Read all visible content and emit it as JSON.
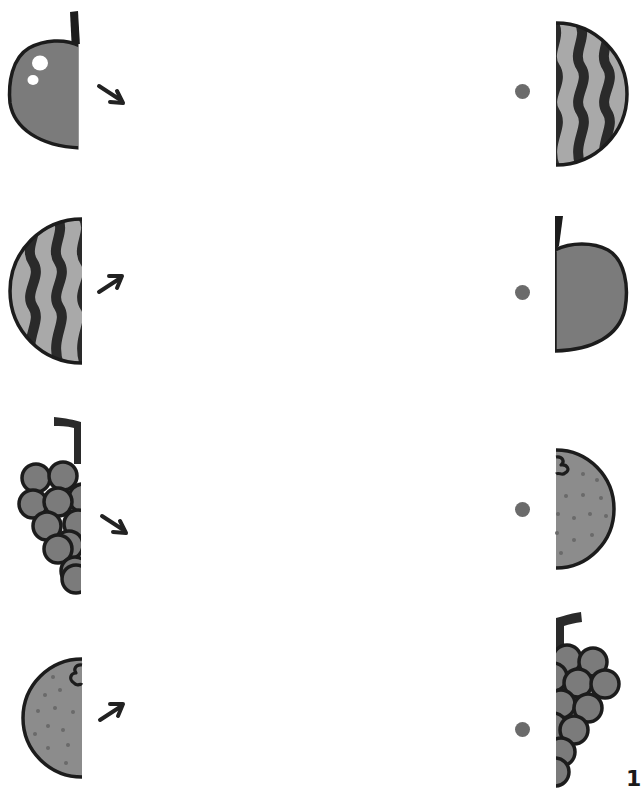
{
  "worksheet": {
    "task": "match-the-halves",
    "page_number": "1",
    "colors": {
      "fruit_fill": "#7b7b7b",
      "outline": "#1c1c1c",
      "stripe_light": "#a9a9a9",
      "stripe_dark": "#2a2a2a",
      "orange_fill": "#8c8c8c",
      "orange_dot": "#6a6a6a",
      "match_dot": "#6b6b6b",
      "arrow": "#222222"
    },
    "left_column": [
      {
        "fruit": "apple",
        "half": "left",
        "arrow": "arrow-down-right"
      },
      {
        "fruit": "watermelon",
        "half": "left",
        "arrow": "arrow-up-right"
      },
      {
        "fruit": "grapes",
        "half": "left",
        "arrow": "arrow-down-right"
      },
      {
        "fruit": "orange",
        "half": "left",
        "arrow": "arrow-up-right"
      }
    ],
    "right_column": [
      {
        "fruit": "watermelon",
        "half": "right",
        "marker": "dot"
      },
      {
        "fruit": "apple",
        "half": "right",
        "marker": "dot"
      },
      {
        "fruit": "orange",
        "half": "right",
        "marker": "dot"
      },
      {
        "fruit": "grapes",
        "half": "right",
        "marker": "dot"
      }
    ]
  }
}
